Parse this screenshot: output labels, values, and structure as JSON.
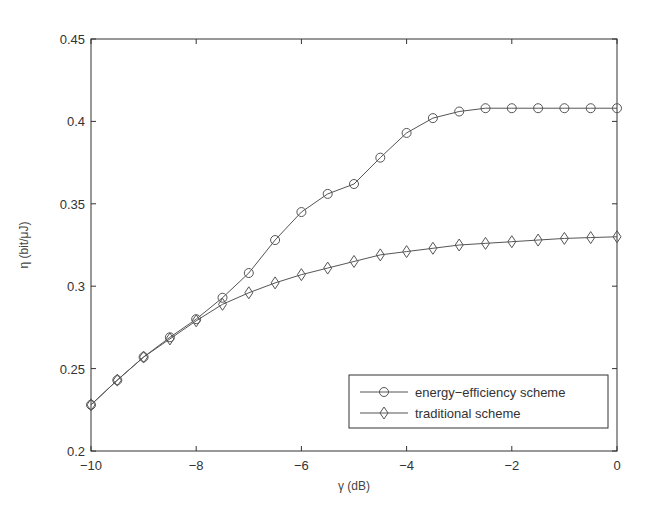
{
  "chart_data": {
    "type": "line",
    "title": "",
    "xlabel": "γ (dB)",
    "ylabel": "η (bit/μJ)",
    "xlim": [
      -10,
      0
    ],
    "ylim": [
      0.2,
      0.45
    ],
    "xticks": [
      -10,
      -8,
      -6,
      -4,
      -2,
      0
    ],
    "xtick_labels": [
      "−10",
      "−8",
      "−6",
      "−4",
      "−2",
      "0"
    ],
    "yticks": [
      0.2,
      0.25,
      0.3,
      0.35,
      0.4,
      0.45
    ],
    "ytick_labels": [
      "0.2",
      "0.25",
      "0.3",
      "0.35",
      "0.4",
      "0.45"
    ],
    "grid": false,
    "legend_position": "lower right",
    "x": [
      -10,
      -9.5,
      -9,
      -8.5,
      -8,
      -7.5,
      -7,
      -6.5,
      -6,
      -5.5,
      -5,
      -4.5,
      -4,
      -3.5,
      -3,
      -2.5,
      -2,
      -1.5,
      -1,
      -0.5,
      0
    ],
    "series": [
      {
        "name": "energy−efficiency scheme",
        "marker": "circle",
        "values": [
          0.228,
          0.243,
          0.257,
          0.269,
          0.28,
          0.293,
          0.308,
          0.328,
          0.345,
          0.356,
          0.362,
          0.378,
          0.393,
          0.402,
          0.406,
          0.408,
          0.408,
          0.408,
          0.408,
          0.408,
          0.408
        ]
      },
      {
        "name": "traditional scheme",
        "marker": "diamond",
        "values": [
          0.228,
          0.243,
          0.257,
          0.268,
          0.279,
          0.289,
          0.296,
          0.302,
          0.307,
          0.311,
          0.315,
          0.319,
          0.321,
          0.323,
          0.325,
          0.326,
          0.327,
          0.328,
          0.329,
          0.3295,
          0.33
        ]
      }
    ]
  },
  "colors": {
    "line": "#555555",
    "axis": "#333333"
  }
}
